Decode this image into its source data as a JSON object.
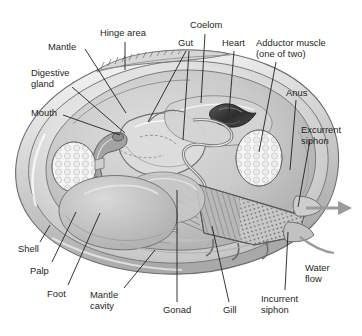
{
  "figure": {
    "background_color": "#ffffff",
    "ink_color": "#231f20",
    "leader_line_color": "#231f20",
    "arrow_color": "#9b9b9b",
    "shell_fill": "#e8e8e8",
    "body_fill": "#cfcfcf",
    "heart_fill": "#3a3a3a",
    "adductor_fill": "#f2f2f2",
    "gill_fill": "#b5b5b5"
  },
  "labels": [
    {
      "id": "hinge-area",
      "text": "Hinge area",
      "x": 100,
      "y": 27,
      "align": "left"
    },
    {
      "id": "mantle",
      "text": "Mantle",
      "x": 48,
      "y": 41,
      "align": "left"
    },
    {
      "id": "gut",
      "text": "Gut",
      "x": 178,
      "y": 37,
      "align": "left"
    },
    {
      "id": "coelom",
      "text": "Coelom",
      "x": 190,
      "y": 19,
      "align": "left"
    },
    {
      "id": "heart",
      "text": "Heart",
      "x": 222,
      "y": 37,
      "align": "left"
    },
    {
      "id": "adductor-muscle",
      "text": "Adductor muscle\n(one of two)",
      "x": 256,
      "y": 37,
      "align": "left"
    },
    {
      "id": "digestive-gland",
      "text": "Digestive\ngland",
      "x": 31,
      "y": 67,
      "align": "left"
    },
    {
      "id": "anus",
      "text": "Anus",
      "x": 286,
      "y": 87,
      "align": "left"
    },
    {
      "id": "mouth",
      "text": "Mouth",
      "x": 31,
      "y": 107,
      "align": "left"
    },
    {
      "id": "excurrent-siphon",
      "text": "Excurrent\nsiphon",
      "x": 301,
      "y": 124,
      "align": "left"
    },
    {
      "id": "shell",
      "text": "Shell",
      "x": 18,
      "y": 243,
      "align": "left"
    },
    {
      "id": "palp",
      "text": "Palp",
      "x": 30,
      "y": 265,
      "align": "left"
    },
    {
      "id": "foot",
      "text": "Foot",
      "x": 47,
      "y": 288,
      "align": "left"
    },
    {
      "id": "mantle-cavity",
      "text": "Mantle\ncavity",
      "x": 90,
      "y": 289,
      "align": "left"
    },
    {
      "id": "gonad",
      "text": "Gonad",
      "x": 163,
      "y": 304,
      "align": "left"
    },
    {
      "id": "gill",
      "text": "Gill",
      "x": 223,
      "y": 304,
      "align": "left"
    },
    {
      "id": "incurrent-siphon",
      "text": "Incurrent\nsiphon",
      "x": 261,
      "y": 293,
      "align": "left"
    },
    {
      "id": "water-flow",
      "text": "Water\nflow",
      "x": 305,
      "y": 262,
      "align": "left"
    }
  ],
  "leader_lines": [
    {
      "id": "leader-hinge-area",
      "x1": 125,
      "y1": 42,
      "x2": 125,
      "y2": 70
    },
    {
      "id": "leader-mantle",
      "x1": 85,
      "y1": 49,
      "x2": 126,
      "y2": 113
    },
    {
      "id": "leader-gut-upper",
      "x1": 186,
      "y1": 51,
      "x2": 148,
      "y2": 122
    },
    {
      "id": "leader-gut-lower",
      "x1": 189,
      "y1": 51,
      "x2": 183,
      "y2": 140
    },
    {
      "id": "leader-coelom",
      "x1": 205,
      "y1": 34,
      "x2": 201,
      "y2": 103
    },
    {
      "id": "leader-heart",
      "x1": 234,
      "y1": 51,
      "x2": 229,
      "y2": 113
    },
    {
      "id": "leader-adductor-muscle",
      "x1": 276,
      "y1": 62,
      "x2": 259,
      "y2": 152
    },
    {
      "id": "leader-digestive-gland",
      "x1": 72,
      "y1": 87,
      "x2": 125,
      "y2": 133
    },
    {
      "id": "leader-anus",
      "x1": 296,
      "y1": 100,
      "x2": 290,
      "y2": 170
    },
    {
      "id": "leader-mouth",
      "x1": 63,
      "y1": 115,
      "x2": 120,
      "y2": 135
    },
    {
      "id": "leader-excurrent-siphon",
      "x1": 310,
      "y1": 140,
      "x2": 298,
      "y2": 207
    },
    {
      "id": "leader-shell",
      "x1": 40,
      "y1": 242,
      "x2": 50,
      "y2": 225
    },
    {
      "id": "leader-palp",
      "x1": 52,
      "y1": 262,
      "x2": 76,
      "y2": 212
    },
    {
      "id": "leader-foot",
      "x1": 68,
      "y1": 285,
      "x2": 100,
      "y2": 213
    },
    {
      "id": "leader-mantle-cavity",
      "x1": 124,
      "y1": 288,
      "x2": 155,
      "y2": 250
    },
    {
      "id": "leader-gonad",
      "x1": 177,
      "y1": 302,
      "x2": 177,
      "y2": 190
    },
    {
      "id": "leader-gill",
      "x1": 229,
      "y1": 302,
      "x2": 212,
      "y2": 226
    },
    {
      "id": "leader-incurrent-siphon",
      "x1": 285,
      "y1": 290,
      "x2": 288,
      "y2": 232
    }
  ],
  "structures": [
    {
      "id": "shell-outline",
      "name": "shell"
    },
    {
      "id": "hinge-ridges",
      "name": "hinge area"
    },
    {
      "id": "mantle-edge",
      "name": "mantle"
    },
    {
      "id": "digestive-gland",
      "name": "digestive gland"
    },
    {
      "id": "mouth-palp",
      "name": "mouth and palp"
    },
    {
      "id": "gut-coil",
      "name": "gut"
    },
    {
      "id": "heart",
      "name": "heart"
    },
    {
      "id": "coelom",
      "name": "coelom"
    },
    {
      "id": "adductor-left",
      "name": "anterior adductor muscle"
    },
    {
      "id": "adductor-right",
      "name": "posterior adductor muscle"
    },
    {
      "id": "gill",
      "name": "gill"
    },
    {
      "id": "gonad",
      "name": "gonad"
    },
    {
      "id": "foot",
      "name": "foot"
    },
    {
      "id": "mantle-cavity",
      "name": "mantle cavity"
    },
    {
      "id": "incurrent-siphon",
      "name": "incurrent siphon"
    },
    {
      "id": "excurrent-siphon",
      "name": "excurrent siphon"
    },
    {
      "id": "water-flow-arrow",
      "name": "water flow arrow"
    }
  ]
}
